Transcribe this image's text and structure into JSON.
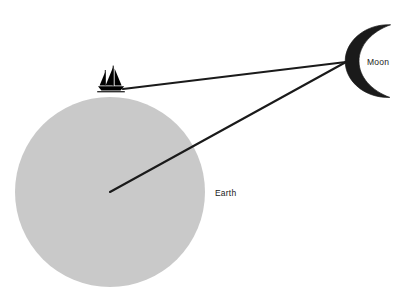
{
  "diagram": {
    "background_color": "#ffffff",
    "line_color": "#1a1a1a",
    "labels": {
      "earth": "Earth",
      "moon": "Moon"
    },
    "earth": {
      "name": "Earth",
      "shape": "circle",
      "fill_color": "#c9c9c9",
      "center_x": 110,
      "center_y": 192,
      "radius": 95
    },
    "moon": {
      "name": "Moon",
      "shape": "crescent",
      "fill_color": "#1a1a1a",
      "center_x": 368,
      "center_y": 61,
      "radius": 36,
      "opening": "right"
    },
    "observer": {
      "name": "sailboat",
      "description": "Sailboat on Earth's surface",
      "fill_color": "#000000",
      "x": 112,
      "y": 83
    },
    "sight_lines": [
      {
        "name": "boat-to-moon",
        "from": "sailboat",
        "to": "moon",
        "x1": 123,
        "y1": 89,
        "x2": 346,
        "y2": 62
      },
      {
        "name": "earth-center-to-moon",
        "from": "earth-center",
        "to": "moon",
        "x1": 110,
        "y1": 192,
        "x2": 346,
        "y2": 62
      }
    ],
    "label_positions": {
      "earth": {
        "x": 215,
        "y": 193
      },
      "moon": {
        "x": 367,
        "y": 62
      }
    }
  }
}
